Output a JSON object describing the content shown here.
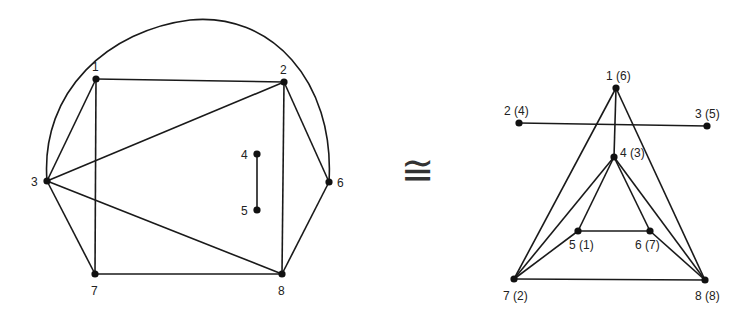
{
  "symbol": "≅",
  "left_graph": {
    "vertices": [
      {
        "id": "1",
        "label": "1",
        "x": 96,
        "y": 79,
        "lx": 92,
        "ly": 71
      },
      {
        "id": "2",
        "label": "2",
        "x": 284,
        "y": 82,
        "lx": 280,
        "ly": 74
      },
      {
        "id": "3",
        "label": "3",
        "x": 47,
        "y": 181,
        "lx": 31,
        "ly": 186
      },
      {
        "id": "4",
        "label": "4",
        "x": 257,
        "y": 154,
        "lx": 241,
        "ly": 159
      },
      {
        "id": "5",
        "label": "5",
        "x": 257,
        "y": 210,
        "lx": 241,
        "ly": 215
      },
      {
        "id": "6",
        "label": "6",
        "x": 329,
        "y": 182,
        "lx": 337,
        "ly": 187
      },
      {
        "id": "7",
        "label": "7",
        "x": 95,
        "y": 274,
        "lx": 91,
        "ly": 295
      },
      {
        "id": "8",
        "label": "8",
        "x": 282,
        "y": 274,
        "lx": 278,
        "ly": 295
      }
    ],
    "edges": [
      [
        "1",
        "2"
      ],
      [
        "1",
        "3"
      ],
      [
        "1",
        "7"
      ],
      [
        "2",
        "3"
      ],
      [
        "2",
        "8"
      ],
      [
        "2",
        "6"
      ],
      [
        "3",
        "7"
      ],
      [
        "3",
        "8"
      ],
      [
        "7",
        "8"
      ],
      [
        "8",
        "6"
      ],
      [
        "4",
        "5"
      ]
    ],
    "arc": {
      "from": "3",
      "to": "6",
      "path": "M47,181 C40,90 110,30 190,20 C270,12 335,80 329,182"
    }
  },
  "right_graph": {
    "vertices": [
      {
        "id": "1",
        "label": "1 (6)",
        "x": 616,
        "y": 88,
        "lx": 606,
        "ly": 80
      },
      {
        "id": "2",
        "label": "2 (4)",
        "x": 519,
        "y": 123,
        "lx": 504,
        "ly": 115
      },
      {
        "id": "3",
        "label": "3 (5)",
        "x": 707,
        "y": 126,
        "lx": 695,
        "ly": 118
      },
      {
        "id": "4",
        "label": "4 (3)",
        "x": 614,
        "y": 157,
        "lx": 620,
        "ly": 157
      },
      {
        "id": "5",
        "label": "5 (1)",
        "x": 578,
        "y": 231,
        "lx": 569,
        "ly": 249
      },
      {
        "id": "6",
        "label": "6 (7)",
        "x": 650,
        "y": 231,
        "lx": 635,
        "ly": 249
      },
      {
        "id": "7",
        "label": "7 (2)",
        "x": 514,
        "y": 279,
        "lx": 503,
        "ly": 300
      },
      {
        "id": "8",
        "label": "8 (8)",
        "x": 705,
        "y": 280,
        "lx": 695,
        "ly": 300
      }
    ],
    "edges": [
      [
        "1",
        "7"
      ],
      [
        "1",
        "8"
      ],
      [
        "1",
        "4"
      ],
      [
        "2",
        "3"
      ],
      [
        "4",
        "5"
      ],
      [
        "4",
        "6"
      ],
      [
        "4",
        "7"
      ],
      [
        "4",
        "8"
      ],
      [
        "5",
        "6"
      ],
      [
        "5",
        "7"
      ],
      [
        "6",
        "8"
      ],
      [
        "7",
        "8"
      ]
    ]
  }
}
